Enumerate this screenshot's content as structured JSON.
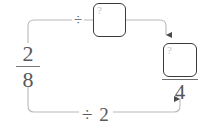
{
  "diagram": {
    "type": "equivalent-fraction-flow",
    "title": "",
    "source_fraction": {
      "numerator": "2",
      "denominator": "8"
    },
    "operations": {
      "top_label": "÷",
      "bottom_label": "÷ 2"
    },
    "answer_boxes": {
      "numerator_box": {
        "hint": "?",
        "value": ""
      },
      "denominator_box": {
        "hint": "?",
        "value": ""
      }
    },
    "result_fraction": {
      "numerator": "",
      "denominator": "4"
    },
    "colors": {
      "line": "#b9b9bb",
      "box_border": "#3a3a3c",
      "text": "#58585a",
      "hint": "#c2c2c4",
      "arrow": "#4a4a4c",
      "background": "#ffffff"
    }
  }
}
